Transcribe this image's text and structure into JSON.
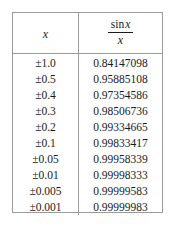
{
  "table": {
    "headers": {
      "x_label": "x",
      "fraction_numerator_op": "sin",
      "fraction_numerator_var": "x",
      "fraction_denominator": "x"
    },
    "rows": [
      {
        "x": "±1.0",
        "value": "0.84147098"
      },
      {
        "x": "±0.5",
        "value": "0.95885108"
      },
      {
        "x": "±0.4",
        "value": "0.97354586"
      },
      {
        "x": "±0.3",
        "value": "0.98506736"
      },
      {
        "x": "±0.2",
        "value": "0.99334665"
      },
      {
        "x": "±0.1",
        "value": "0.99833417"
      },
      {
        "x": "±0.05",
        "value": "0.99958339"
      },
      {
        "x": "±0.01",
        "value": "0.99998333"
      },
      {
        "x": "±0.005",
        "value": "0.99999583"
      },
      {
        "x": "±0.001",
        "value": "0.99999983"
      }
    ]
  },
  "style": {
    "border_color": "#9a9a9a",
    "text_color": "#1a1a1a",
    "background": "#ffffff"
  }
}
